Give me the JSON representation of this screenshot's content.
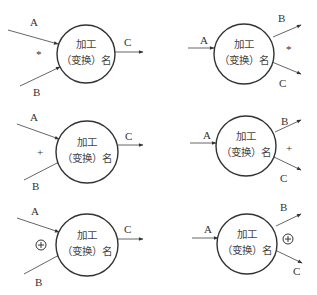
{
  "diagram": {
    "node_label_line1": "加工",
    "node_label_line2": "（变换）名",
    "panels": [
      {
        "id": "merge-and",
        "mode": "merge",
        "operator": "*",
        "inputs": [
          "A",
          "B"
        ],
        "outputs": [
          "C"
        ]
      },
      {
        "id": "split-and",
        "mode": "split",
        "operator": "*",
        "inputs": [
          "A"
        ],
        "outputs": [
          "B",
          "C"
        ]
      },
      {
        "id": "merge-or",
        "mode": "merge",
        "operator": "+",
        "inputs": [
          "A",
          "B"
        ],
        "outputs": [
          "C"
        ]
      },
      {
        "id": "split-or",
        "mode": "split",
        "operator": "+",
        "inputs": [
          "A"
        ],
        "outputs": [
          "B",
          "C"
        ]
      },
      {
        "id": "merge-xor",
        "mode": "merge",
        "operator": "⊕",
        "inputs": [
          "A",
          "B"
        ],
        "outputs": [
          "C"
        ]
      },
      {
        "id": "split-xor",
        "mode": "split",
        "operator": "⊕",
        "inputs": [
          "A"
        ],
        "outputs": [
          "B",
          "C"
        ]
      }
    ]
  }
}
